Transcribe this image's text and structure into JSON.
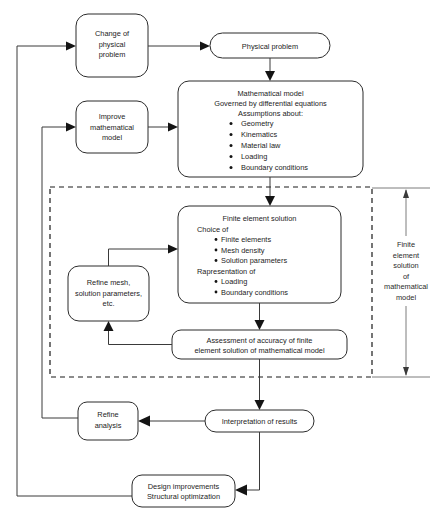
{
  "diagram": {
    "colors": {
      "box_stroke": "#2b2b2b",
      "connector": "#3a3a3a",
      "dashed_region": "#1a1a1a",
      "text": "#1c1c1c",
      "background": "#ffffff"
    },
    "nodes": {
      "change_physical_problem": {
        "lines": [
          "Change of",
          "physical",
          "problem"
        ],
        "shape": "rounded-rect"
      },
      "physical_problem": {
        "lines": [
          "Physical problem"
        ],
        "shape": "stadium"
      },
      "mathematical_model": {
        "heading": [
          "Mathematical model",
          "Governed by differential equations",
          "Assumptions about:"
        ],
        "bullets": [
          "Geometry",
          "Kinematics",
          "Material law",
          "Loading",
          "Boundary conditions"
        ],
        "shape": "rounded-rect"
      },
      "improve_mathematical_model": {
        "lines": [
          "Improve",
          "mathematical",
          "model"
        ],
        "shape": "rounded-rect"
      },
      "finite_element_solution": {
        "heading1": "Finite element solution",
        "subheading1": "Choice of",
        "bullets1": [
          "Finite elements",
          "Mesh density",
          "Solution parameters"
        ],
        "subheading2": "Rapresentation of",
        "bullets2": [
          "Loading",
          "Boundary conditions"
        ],
        "shape": "rounded-rect"
      },
      "refine_mesh": {
        "lines": [
          "Refine mesh,",
          "solution parameters,",
          "etc."
        ],
        "shape": "rounded-rect"
      },
      "assessment": {
        "lines": [
          "Assessment of accuracy of finite",
          "element solution of mathematical model"
        ],
        "shape": "stadium-rect"
      },
      "interpretation": {
        "lines": [
          "Interpretation of results"
        ],
        "shape": "stadium"
      },
      "refine_analysis": {
        "lines": [
          "Refine",
          "analysis"
        ],
        "shape": "rounded-rect"
      },
      "design_improvements": {
        "lines": [
          "Design improvements",
          "Structural optimization"
        ],
        "shape": "rounded-rect"
      }
    },
    "annotations": {
      "dimension_label": {
        "lines": [
          "Finite",
          "element",
          "solution",
          "of",
          "mathematical",
          "model"
        ],
        "style": "double-headed-dimension-arrow"
      },
      "dashed_region_label": "finite element solution region"
    }
  }
}
